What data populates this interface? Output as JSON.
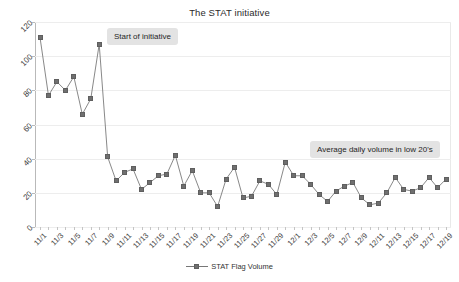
{
  "chart_data": {
    "type": "line",
    "title": "The STAT initiative",
    "xlabel": "",
    "ylabel": "",
    "ylim": [
      0,
      120
    ],
    "yticks": [
      0,
      20,
      40,
      60,
      80,
      100,
      120
    ],
    "grid": true,
    "legend_position": "bottom",
    "series": [
      {
        "name": "STAT Flag Volume",
        "color": "#6f6f6f",
        "marker": "square",
        "values": [
          111,
          77,
          85,
          80,
          88,
          66,
          75,
          107,
          41,
          27,
          32,
          34,
          22,
          26,
          30,
          31,
          42,
          24,
          33,
          20,
          20,
          12,
          28,
          35,
          17,
          18,
          27,
          25,
          19,
          38,
          30,
          30,
          25,
          19,
          15,
          21,
          24,
          26,
          17,
          13,
          14,
          20,
          29,
          22,
          21,
          23,
          29,
          23,
          28
        ]
      }
    ],
    "x": [
      "11/1",
      "11/2",
      "11/3",
      "11/4",
      "11/5",
      "11/6",
      "11/7",
      "11/8",
      "11/9",
      "11/10",
      "11/11",
      "11/12",
      "11/13",
      "11/14",
      "11/15",
      "11/16",
      "11/17",
      "11/18",
      "11/19",
      "11/20",
      "11/21",
      "11/22",
      "11/23",
      "11/24",
      "11/25",
      "11/26",
      "11/27",
      "11/28",
      "11/29",
      "11/30",
      "12/1",
      "12/2",
      "12/3",
      "12/4",
      "12/5",
      "12/6",
      "12/7",
      "12/8",
      "12/9",
      "12/10",
      "12/11",
      "12/12",
      "12/13",
      "12/14",
      "12/15",
      "12/16",
      "12/17",
      "12/18",
      "12/19"
    ],
    "xtick_labels": [
      "11/1",
      "11/3",
      "11/5",
      "11/7",
      "11/9",
      "11/11",
      "11/13",
      "11/15",
      "11/17",
      "11/19",
      "11/21",
      "11/23",
      "11/25",
      "11/27",
      "11/29",
      "12/1",
      "12/3",
      "12/5",
      "12/7",
      "12/9",
      "12/11",
      "12/13",
      "12/15",
      "12/17",
      "12/19"
    ],
    "annotations": [
      {
        "id": "start-of-initiative",
        "text": "Start of initiative"
      },
      {
        "id": "average-daily-volume",
        "text": "Average daily volume in low 20's"
      }
    ]
  }
}
